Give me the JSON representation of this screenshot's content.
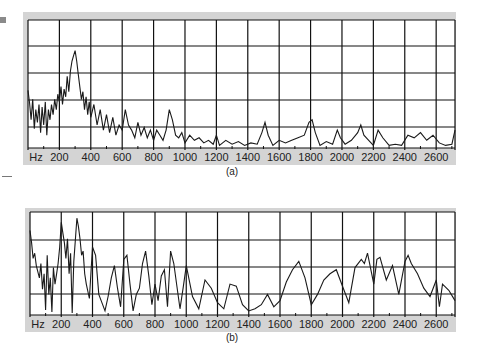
{
  "figure": {
    "caption_a": "(a)",
    "caption_b": "(b)"
  },
  "chart_data": [
    {
      "id": "a",
      "type": "line",
      "title": "",
      "caption": "(a)",
      "xlabel": "Hz",
      "ylabel": "",
      "x_unit": "Hz",
      "xlim": [
        0,
        2720
      ],
      "ylim": [
        0,
        100
      ],
      "grid": true,
      "legend": null,
      "x_tick_labels": [
        "Hz",
        "200",
        "400",
        "600",
        "800",
        "1000",
        "1200",
        "1400",
        "1600",
        "1800",
        "2000",
        "2200",
        "2400",
        "2600"
      ],
      "x_ticks": [
        200,
        400,
        600,
        800,
        1000,
        1200,
        1400,
        1600,
        1800,
        2000,
        2200,
        2400,
        2600
      ],
      "y_gridlines": 4,
      "description": "Speech-like magnitude spectrum with strong peak near 300 Hz, secondary bumps near 620, 900, 1500, 1820, 2120, 2230 Hz; low level elsewhere",
      "series": [
        {
          "name": "spectrum",
          "x": [
            0,
            10,
            20,
            30,
            40,
            50,
            60,
            70,
            80,
            90,
            100,
            110,
            120,
            130,
            140,
            150,
            160,
            170,
            180,
            190,
            200,
            210,
            220,
            230,
            240,
            250,
            260,
            270,
            280,
            290,
            300,
            310,
            320,
            330,
            340,
            350,
            360,
            370,
            380,
            390,
            400,
            420,
            440,
            460,
            480,
            500,
            520,
            540,
            560,
            580,
            600,
            620,
            640,
            660,
            680,
            700,
            720,
            740,
            760,
            780,
            800,
            820,
            840,
            860,
            880,
            900,
            920,
            940,
            960,
            980,
            1000,
            1030,
            1060,
            1090,
            1120,
            1150,
            1180,
            1200,
            1220,
            1260,
            1300,
            1340,
            1380,
            1420,
            1460,
            1490,
            1510,
            1530,
            1560,
            1600,
            1640,
            1680,
            1720,
            1760,
            1790,
            1810,
            1830,
            1860,
            1900,
            1940,
            1970,
            1990,
            2020,
            2060,
            2100,
            2120,
            2140,
            2170,
            2200,
            2230,
            2260,
            2300,
            2340,
            2380,
            2420,
            2460,
            2500,
            2540,
            2580,
            2620,
            2660,
            2700,
            2720
          ],
          "y": [
            45,
            35,
            22,
            38,
            15,
            30,
            20,
            34,
            12,
            32,
            18,
            36,
            10,
            30,
            22,
            34,
            26,
            38,
            30,
            42,
            36,
            48,
            34,
            46,
            40,
            56,
            44,
            60,
            68,
            72,
            76,
            68,
            58,
            48,
            38,
            44,
            30,
            40,
            26,
            36,
            24,
            34,
            18,
            30,
            14,
            26,
            12,
            24,
            10,
            18,
            14,
            30,
            18,
            14,
            8,
            20,
            10,
            16,
            8,
            14,
            6,
            14,
            10,
            6,
            14,
            30,
            22,
            10,
            8,
            12,
            4,
            10,
            6,
            8,
            4,
            6,
            3,
            10,
            2,
            6,
            3,
            5,
            2,
            4,
            3,
            12,
            20,
            10,
            2,
            6,
            4,
            6,
            8,
            10,
            20,
            22,
            12,
            2,
            5,
            3,
            14,
            8,
            3,
            6,
            12,
            18,
            10,
            6,
            2,
            14,
            8,
            2,
            3,
            2,
            10,
            8,
            12,
            6,
            10,
            4,
            2,
            3,
            14
          ]
        }
      ]
    },
    {
      "id": "b",
      "type": "line",
      "title": "",
      "caption": "(b)",
      "xlabel": "Hz",
      "ylabel": "",
      "x_unit": "Hz",
      "xlim": [
        0,
        2720
      ],
      "ylim": [
        0,
        100
      ],
      "grid": true,
      "legend": null,
      "x_tick_labels": [
        "Hz",
        "200",
        "400",
        "600",
        "800",
        "1000",
        "1200",
        "1400",
        "1600",
        "1800",
        "2000",
        "2200",
        "2400",
        "2600"
      ],
      "x_ticks": [
        200,
        400,
        600,
        800,
        1000,
        1200,
        1400,
        1600,
        1800,
        2000,
        2200,
        2400,
        2600
      ],
      "y_gridlines": 3,
      "description": "Noise-like spectrum with peaks near 200 and 300 Hz, then roughly flat fluctuating level across 400–2700 Hz",
      "series": [
        {
          "name": "spectrum",
          "x": [
            0,
            10,
            20,
            30,
            40,
            50,
            60,
            70,
            80,
            90,
            100,
            110,
            120,
            130,
            140,
            150,
            160,
            170,
            180,
            190,
            200,
            210,
            220,
            230,
            240,
            250,
            260,
            270,
            280,
            290,
            300,
            310,
            320,
            330,
            340,
            350,
            360,
            380,
            400,
            420,
            440,
            460,
            480,
            500,
            520,
            540,
            560,
            580,
            600,
            620,
            640,
            660,
            680,
            700,
            720,
            740,
            760,
            780,
            800,
            820,
            840,
            860,
            880,
            900,
            920,
            940,
            960,
            980,
            1000,
            1040,
            1080,
            1120,
            1160,
            1200,
            1240,
            1280,
            1320,
            1360,
            1400,
            1440,
            1480,
            1520,
            1560,
            1600,
            1640,
            1680,
            1720,
            1760,
            1800,
            1840,
            1880,
            1920,
            1960,
            2000,
            2040,
            2080,
            2120,
            2140,
            2160,
            2200,
            2220,
            2240,
            2280,
            2320,
            2360,
            2400,
            2420,
            2440,
            2480,
            2520,
            2560,
            2600,
            2620,
            2640,
            2680,
            2720
          ],
          "y": [
            82,
            70,
            55,
            60,
            48,
            42,
            36,
            50,
            25,
            40,
            5,
            58,
            20,
            36,
            3,
            46,
            30,
            40,
            50,
            66,
            90,
            80,
            70,
            55,
            74,
            40,
            60,
            2,
            52,
            72,
            94,
            86,
            74,
            58,
            62,
            40,
            30,
            16,
            66,
            58,
            20,
            12,
            4,
            18,
            36,
            48,
            26,
            8,
            54,
            58,
            30,
            4,
            20,
            26,
            50,
            62,
            38,
            10,
            30,
            14,
            38,
            44,
            8,
            62,
            50,
            28,
            6,
            26,
            48,
            18,
            6,
            34,
            26,
            12,
            6,
            30,
            28,
            10,
            4,
            6,
            10,
            20,
            8,
            14,
            32,
            44,
            52,
            36,
            10,
            20,
            34,
            40,
            44,
            28,
            12,
            46,
            54,
            50,
            60,
            30,
            54,
            56,
            34,
            48,
            20,
            52,
            58,
            50,
            40,
            26,
            18,
            34,
            8,
            30,
            24,
            14
          ]
        }
      ]
    }
  ]
}
